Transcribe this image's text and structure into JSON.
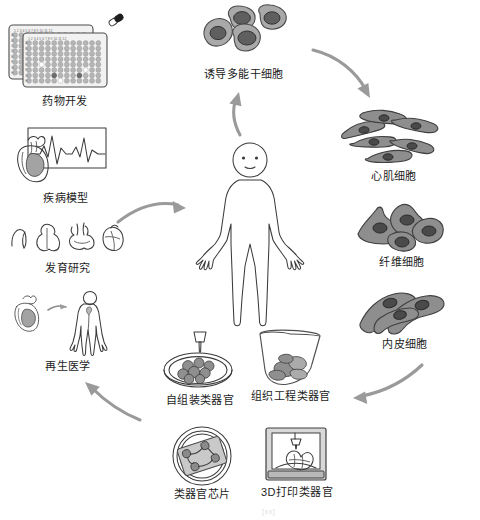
{
  "figure": {
    "title_visible": false,
    "background": "#ffffff",
    "ink_color": "#3b3b3b",
    "arrow_color": "#9a9a9a",
    "cell_fill": "#a9a9a9",
    "nucleus_fill": "#5f5f5f"
  },
  "center": {
    "label": "",
    "icon": "human-body-outline"
  },
  "applications": [
    {
      "id": "drug-development",
      "label": "药物开发",
      "icon": "96-well-plate-with-capsule-icon"
    },
    {
      "id": "disease-model",
      "label": "疾病模型",
      "icon": "heart-ecg-icon"
    },
    {
      "id": "development-study",
      "label": "发育研究",
      "icon": "heart-development-stages-icon"
    },
    {
      "id": "regenerative-medicine",
      "label": "再生医学",
      "icon": "heart-transplant-human-icon"
    }
  ],
  "stem_cell": {
    "id": "ipsc",
    "label": "诱导多能干细胞",
    "icon": "stem-cell-cluster-icon"
  },
  "derived_cells": [
    {
      "id": "cardiomyocyte",
      "label": "心肌细胞",
      "icon": "cardiomyocyte-cells-icon"
    },
    {
      "id": "fibroblast",
      "label": "纤维细胞",
      "icon": "fibroblast-cells-icon"
    },
    {
      "id": "endothelial",
      "label": "内皮细胞",
      "icon": "endothelial-cells-icon"
    }
  ],
  "organoids": [
    {
      "id": "self-assembled-organoid",
      "label": "自组装类器官",
      "icon": "petri-dish-pipette-icon"
    },
    {
      "id": "tissue-engineered-organoid",
      "label": "组织工程类器官",
      "icon": "beaker-tissue-icon"
    },
    {
      "id": "organ-on-chip",
      "label": "类器官芯片",
      "icon": "organ-chip-dish-icon"
    },
    {
      "id": "3d-printed-organoid",
      "label": "3D打印类器官",
      "icon": "3d-bioprinter-icon"
    }
  ],
  "arrows": [
    {
      "id": "arrow-apps-to-body",
      "from": "disease-model",
      "to": "center",
      "direction": "right"
    },
    {
      "id": "arrow-body-to-ipsc",
      "from": "center",
      "to": "ipsc",
      "direction": "up"
    },
    {
      "id": "arrow-ipsc-to-cells",
      "from": "ipsc",
      "to": "cardiomyocyte",
      "direction": "down-right"
    },
    {
      "id": "arrow-cells-to-organoids",
      "from": "endothelial",
      "to": "tissue-engineered-organoid",
      "direction": "down-left"
    },
    {
      "id": "arrow-organoids-to-apps",
      "from": "organ-on-chip",
      "to": "regenerative-medicine",
      "direction": "up-left"
    }
  ],
  "caption": {
    "text": "[xx]",
    "truncated": true
  }
}
